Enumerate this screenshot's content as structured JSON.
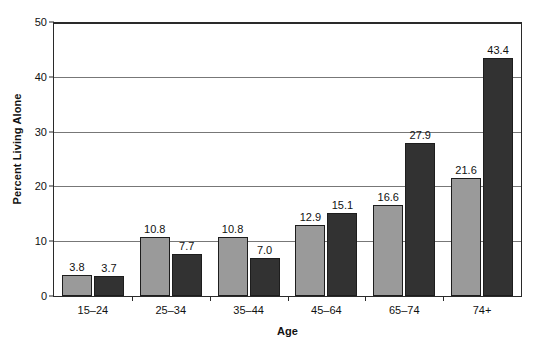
{
  "chart_data": {
    "type": "bar",
    "title": "",
    "xlabel": "Age",
    "ylabel": "Percent Living Alone",
    "categories": [
      "15–24",
      "25–34",
      "35–44",
      "45–64",
      "65–74",
      "74+"
    ],
    "series": [
      {
        "name": "Men",
        "color": "#9a9a9a",
        "values": [
          3.8,
          10.8,
          10.8,
          12.9,
          16.6,
          21.6
        ]
      },
      {
        "name": "Women",
        "color": "#323232",
        "values": [
          3.7,
          7.7,
          7.0,
          15.1,
          27.9,
          43.4
        ]
      }
    ],
    "value_labels": {
      "Men": [
        "3.8",
        "10.8",
        "10.8",
        "12.9",
        "16.6",
        "21.6"
      ],
      "Women": [
        "3.7",
        "7.7",
        "7.0",
        "15.1",
        "27.9",
        "43.4"
      ]
    },
    "ylim": [
      0,
      50
    ],
    "yticks": [
      0,
      10,
      20,
      30,
      40,
      50
    ],
    "ytick_labels": [
      "0",
      "10",
      "20",
      "30",
      "40",
      "50"
    ],
    "grid": true,
    "grid_axis": "y",
    "legend_position": "top-center",
    "bar_border_color": "#1d1d1d",
    "axis_color": "#2a2a2a",
    "gridline_color": "#777777",
    "background": "#ffffff"
  },
  "legend": {
    "items": [
      {
        "label": "Men"
      },
      {
        "label": "Women"
      }
    ]
  }
}
